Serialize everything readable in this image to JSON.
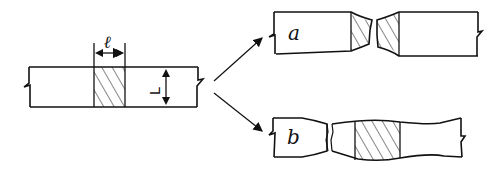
{
  "diagram": {
    "type": "specimen-deformation-schematic",
    "original_specimen": {
      "gauge_width_label": "ℓ",
      "height_label": "L",
      "hatched_gauge": true
    },
    "outcomes": [
      {
        "id": "a",
        "label": "a",
        "description": "fracture localized within hatched gauge region (necked on both halves)"
      },
      {
        "id": "b",
        "label": "b",
        "description": "fracture outside hatched gauge region; gauge region bulged"
      }
    ],
    "arrows": [
      {
        "from": "original_specimen",
        "to": "a"
      },
      {
        "from": "original_specimen",
        "to": "b"
      }
    ],
    "colors": {
      "line": "#111111",
      "background": "#ffffff"
    }
  }
}
